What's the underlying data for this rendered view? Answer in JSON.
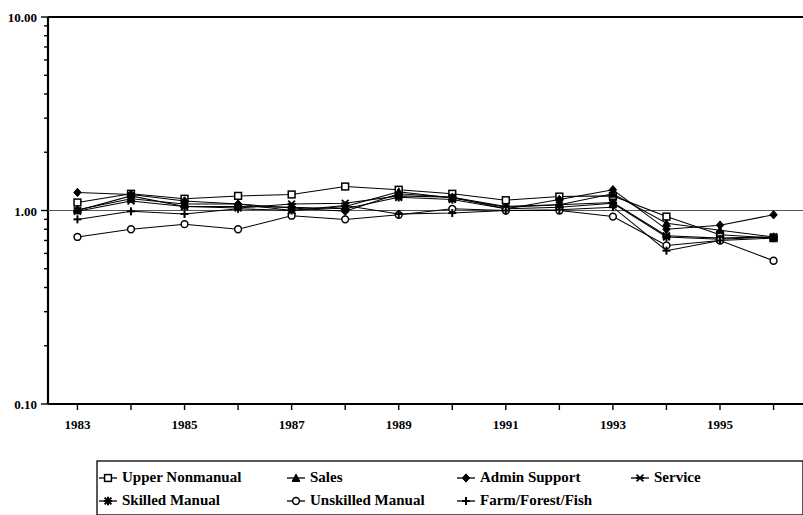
{
  "chart_data": {
    "type": "line",
    "title": "",
    "subtitle": "",
    "xlabel": "",
    "ylabel": "",
    "yscale": "log",
    "ylim": [
      0.1,
      10.0
    ],
    "y_tick_labels": [
      "10.00",
      "1.00",
      "0.10"
    ],
    "y_tick_values": [
      10.0,
      1.0,
      0.1
    ],
    "gridline_at": 1.0,
    "grid": false,
    "legend_position": "bottom",
    "x": [
      1983,
      1984,
      1985,
      1986,
      1987,
      1988,
      1989,
      1990,
      1991,
      1992,
      1993,
      1994,
      1995,
      1996
    ],
    "x_tick_labels": [
      "1983",
      "1985",
      "1987",
      "1989",
      "1991",
      "1993",
      "1995"
    ],
    "x_tick_label_values": [
      1983,
      1985,
      1987,
      1989,
      1991,
      1993,
      1995
    ],
    "xlim": [
      1982.45,
      1996.55
    ],
    "series": [
      {
        "name": "Upper Nonmanual",
        "marker": "square-open",
        "values": [
          1.1,
          1.22,
          1.15,
          1.19,
          1.21,
          1.33,
          1.28,
          1.22,
          1.13,
          1.18,
          1.19,
          0.93,
          0.75,
          0.72
        ]
      },
      {
        "name": "Sales",
        "marker": "triangle-filled",
        "values": [
          1.01,
          1.15,
          1.08,
          1.08,
          1.0,
          1.05,
          1.25,
          1.16,
          1.04,
          1.07,
          1.22,
          0.86,
          0.79,
          0.73
        ]
      },
      {
        "name": "Admin Support",
        "marker": "diamond-filled",
        "values": [
          1.24,
          1.21,
          1.12,
          1.08,
          1.03,
          0.99,
          1.22,
          1.17,
          1.02,
          1.14,
          1.28,
          0.8,
          0.84,
          0.95
        ]
      },
      {
        "name": "Service",
        "marker": "asterisk",
        "values": [
          0.99,
          1.12,
          1.05,
          1.03,
          1.08,
          1.09,
          1.19,
          1.17,
          1.05,
          1.07,
          1.1,
          0.74,
          0.72,
          0.73
        ]
      },
      {
        "name": "Skilled Manual",
        "marker": "star-filled",
        "values": [
          1.0,
          1.19,
          1.05,
          1.05,
          1.04,
          1.02,
          1.17,
          1.14,
          1.02,
          1.04,
          1.09,
          0.73,
          0.71,
          0.73
        ]
      },
      {
        "name": "Unskilled Manual",
        "marker": "circle-open",
        "values": [
          0.73,
          0.8,
          0.85,
          0.8,
          0.94,
          0.9,
          0.95,
          1.02,
          1.0,
          1.0,
          0.93,
          0.66,
          0.7,
          0.55
        ]
      },
      {
        "name": "Farm/Forest/Fish",
        "marker": "plus",
        "values": [
          0.9,
          0.99,
          0.96,
          1.02,
          1.0,
          1.06,
          0.96,
          0.97,
          1.0,
          1.01,
          1.04,
          0.62,
          0.7,
          0.72
        ]
      }
    ],
    "legend_rows": [
      [
        "Upper Nonmanual",
        "Sales",
        "Admin Support",
        "Service"
      ],
      [
        "Skilled Manual",
        "Unskilled Manual",
        "Farm/Forest/Fish"
      ]
    ]
  }
}
